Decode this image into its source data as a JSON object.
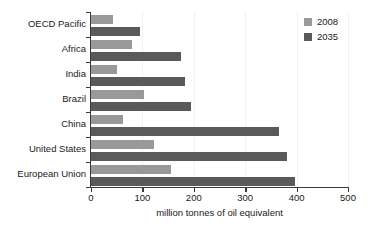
{
  "chart_data": {
    "type": "bar",
    "orientation": "horizontal",
    "title": "",
    "xlabel": "million tonnes of oil equivalent",
    "ylabel": "",
    "xlim": [
      0,
      500
    ],
    "xticks": [
      0,
      100,
      200,
      300,
      400,
      500
    ],
    "xtick_labels": [
      "0",
      "100",
      "200",
      "300",
      "400",
      "500"
    ],
    "grid": true,
    "legend_position": "top-right",
    "categories": [
      "OECD Pacific",
      "Africa",
      "India",
      "Brazil",
      "China",
      "United States",
      "European Union"
    ],
    "series": [
      {
        "name": "2008",
        "color": "#999999",
        "values": [
          43,
          80,
          50,
          103,
          62,
          123,
          156
        ]
      },
      {
        "name": "2035",
        "color": "#5a5a5a",
        "values": [
          95,
          175,
          182,
          195,
          365,
          382,
          396
        ]
      }
    ]
  }
}
